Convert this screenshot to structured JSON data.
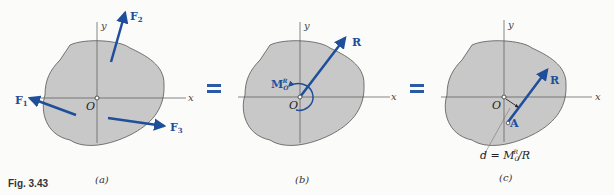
{
  "figure": {
    "label": "Fig. 3.43",
    "panels": [
      {
        "id": "a",
        "caption": "(a)",
        "axes": {
          "x": "x",
          "y": "y",
          "origin": "O"
        },
        "forces": [
          "F1",
          "F2",
          "F3"
        ]
      },
      {
        "id": "b",
        "caption": "(b)",
        "axes": {
          "x": "x",
          "y": "y",
          "origin": "O"
        },
        "resultant": "R",
        "moment": "M_O^R"
      },
      {
        "id": "c",
        "caption": "(c)",
        "axes": {
          "x": "x",
          "y": "y",
          "origin": "O"
        },
        "resultant": "R",
        "point": "A",
        "distance_equation": "d = M_O^R / R"
      }
    ],
    "equals": [
      "=",
      "="
    ],
    "colors": {
      "vector": "#1f4f9a",
      "body_fill": "#c8c8c8",
      "body_stroke": "#555555"
    }
  }
}
